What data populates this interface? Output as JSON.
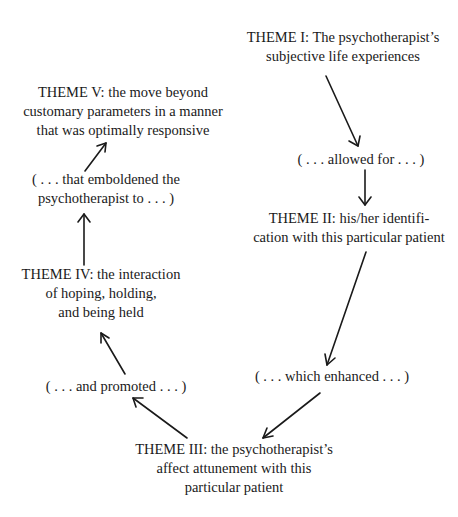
{
  "diagram": {
    "type": "cyclic-flow",
    "nodes": {
      "theme1": {
        "lines": [
          "THEME I:  The psychotherapist’s",
          "subjective life experiences"
        ]
      },
      "link1": {
        "lines": [
          "( . . . allowed for . . . )"
        ]
      },
      "theme2": {
        "lines": [
          "THEME II:  his/her identifi-",
          "cation with this particular patient"
        ]
      },
      "link2": {
        "lines": [
          "( . . . which enhanced . . . )"
        ]
      },
      "theme3": {
        "lines": [
          "THEME III:  the psychotherapist’s",
          "affect attunement with this",
          "particular patient"
        ]
      },
      "link3": {
        "lines": [
          "( . . . and promoted . . . )"
        ]
      },
      "theme4": {
        "lines": [
          "THEME IV:  the interaction",
          "of hoping, holding,",
          "and being held"
        ]
      },
      "link4": {
        "lines": [
          "( . . . that emboldened the",
          "psychotherapist to . . . )"
        ]
      },
      "theme5": {
        "lines": [
          "THEME V:  the move beyond",
          "customary parameters in a manner",
          "that was optimally responsive"
        ]
      }
    },
    "edges": [
      {
        "from": "theme1",
        "to": "link1"
      },
      {
        "from": "link1",
        "to": "theme2"
      },
      {
        "from": "theme2",
        "to": "link2"
      },
      {
        "from": "link2",
        "to": "theme3"
      },
      {
        "from": "theme3",
        "to": "link3"
      },
      {
        "from": "link3",
        "to": "theme4"
      },
      {
        "from": "theme4",
        "to": "link4"
      },
      {
        "from": "link4",
        "to": "theme5"
      }
    ]
  }
}
